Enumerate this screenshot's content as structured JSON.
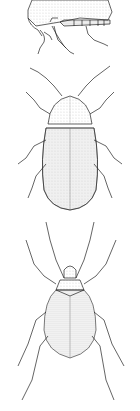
{
  "image": {
    "description": "Black-and-white stippled scientific illustration of three beetles stacked vertically",
    "background": "#ffffff",
    "ink": "#222222",
    "figures": [
      {
        "label": "beetle-side-view",
        "view": "lateral, partially cropped at top"
      },
      {
        "label": "beetle-dorsal-oval",
        "view": "dorsal, oval elytra with fine striations"
      },
      {
        "label": "beetle-dorsal-pear",
        "view": "dorsal, pear-shaped body with long antennae and legs"
      }
    ]
  }
}
